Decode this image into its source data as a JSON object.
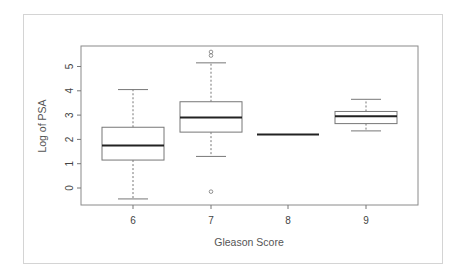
{
  "chart_data": {
    "type": "box",
    "title": "",
    "xlabel": "Gleason Score",
    "ylabel": "Log of PSA",
    "categories": [
      "6",
      "7",
      "8",
      "9"
    ],
    "yticks": [
      0,
      1,
      2,
      3,
      4,
      5
    ],
    "ylim": [
      -0.7,
      5.85
    ],
    "grid": false,
    "legend": null,
    "boxes": [
      {
        "category": "6",
        "whisker_low": -0.45,
        "q1": 1.15,
        "median": 1.75,
        "q3": 2.5,
        "whisker_high": 4.05,
        "outliers": []
      },
      {
        "category": "7",
        "whisker_low": 1.3,
        "q1": 2.3,
        "median": 2.9,
        "q3": 3.55,
        "whisker_high": 5.15,
        "outliers": [
          5.45,
          5.6,
          -0.15
        ]
      },
      {
        "category": "8",
        "whisker_low": 2.2,
        "q1": 2.2,
        "median": 2.2,
        "q3": 2.2,
        "whisker_high": 2.2,
        "outliers": []
      },
      {
        "category": "9",
        "whisker_low": 2.35,
        "q1": 2.65,
        "median": 2.95,
        "q3": 3.15,
        "whisker_high": 3.65,
        "outliers": []
      }
    ]
  },
  "axes": {
    "x_title": "Gleason Score",
    "y_title": "Log of PSA"
  }
}
